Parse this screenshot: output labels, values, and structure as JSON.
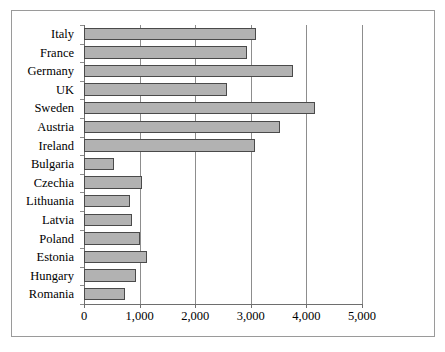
{
  "chart_data": {
    "type": "bar",
    "orientation": "horizontal",
    "title": "",
    "subtitle": "",
    "xlabel": "",
    "ylabel": "",
    "xlim": [
      0,
      5000
    ],
    "x_ticks": [
      0,
      1000,
      2000,
      3000,
      4000,
      5000
    ],
    "x_tick_labels": [
      "0",
      "1,000",
      "2,000",
      "3,000",
      "4,000",
      "5,000"
    ],
    "grid": true,
    "grid_axis": "x",
    "legend": false,
    "legend_position": "none",
    "categories": [
      "Italy",
      "France",
      "Germany",
      "UK",
      "Sweden",
      "Austria",
      "Ireland",
      "Bulgaria",
      "Czechia",
      "Lithuania",
      "Latvia",
      "Poland",
      "Estonia",
      "Hungary",
      "Romania"
    ],
    "values": [
      3100,
      2930,
      3750,
      2570,
      4150,
      3520,
      3080,
      540,
      1040,
      820,
      870,
      1000,
      1140,
      930,
      730
    ],
    "series": [
      {
        "name": "",
        "values": [
          3100,
          2930,
          3750,
          2570,
          4150,
          3520,
          3080,
          540,
          1040,
          820,
          870,
          1000,
          1140,
          930,
          730
        ]
      }
    ],
    "colors": {
      "bar_fill": "#b2b2b2",
      "bar_border": "#4a4a4a",
      "gridline": "#8d8d8d",
      "axis": "#6e6e6e",
      "frame": "#9a9a9a",
      "text": "#000000",
      "background": "#ffffff"
    }
  }
}
